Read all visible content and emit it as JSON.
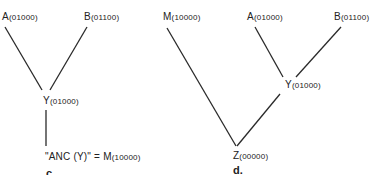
{
  "panels": [
    {
      "id": "c",
      "label": "c.",
      "nodes": {
        "A": {
          "name": "A",
          "code": "(01000)"
        },
        "B": {
          "name": "B",
          "code": "(01100)"
        },
        "Y": {
          "name": "Y",
          "code": "(01000)"
        },
        "anc": {
          "prefix": "\"ANC (Y)\" = ",
          "name": "M",
          "code": "(10000)"
        }
      },
      "edges": [
        [
          "A",
          "Y"
        ],
        [
          "B",
          "Y"
        ],
        [
          "Y",
          "ANC(Y)"
        ]
      ]
    },
    {
      "id": "d",
      "label": "d.",
      "nodes": {
        "M": {
          "name": "M",
          "code": "(10000)"
        },
        "A": {
          "name": "A",
          "code": "(01000)"
        },
        "B": {
          "name": "B",
          "code": "(01100)"
        },
        "Y": {
          "name": "Y",
          "code": "(01000)"
        },
        "Z": {
          "name": "Z",
          "code": "(00000)"
        }
      },
      "edges": [
        [
          "A",
          "Y"
        ],
        [
          "B",
          "Y"
        ],
        [
          "Y",
          "Z"
        ],
        [
          "M",
          "Z"
        ]
      ]
    }
  ],
  "colors": {
    "line": "#2a2a2a",
    "text": "#222222",
    "background": "#ffffff"
  }
}
